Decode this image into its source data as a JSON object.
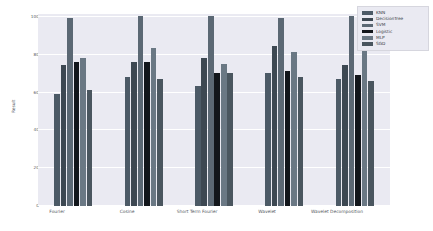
{
  "chart_data": {
    "type": "bar",
    "title": "",
    "xlabel": "",
    "ylabel": "Result",
    "ylim": [
      0,
      100
    ],
    "yticks": [
      "0",
      "20",
      "40",
      "60",
      "80",
      "100"
    ],
    "grid": true,
    "legend_position": "upper right",
    "categories": [
      "Fourier",
      "Cosine",
      "Short Term Fourier",
      "Wavelet",
      "Wavelet Decomposition"
    ],
    "series": [
      {
        "name": "KNN",
        "color": "#4c5a66",
        "values": [
          59,
          68,
          63,
          70,
          67
        ]
      },
      {
        "name": "DecisionTree",
        "color": "#3d4852",
        "values": [
          74,
          76,
          78,
          84,
          74
        ]
      },
      {
        "name": "SVM",
        "color": "#5b6874",
        "values": [
          99,
          100,
          100,
          99,
          100
        ]
      },
      {
        "name": "Logistic",
        "color": "#12161b",
        "values": [
          76,
          76,
          70,
          71,
          69
        ]
      },
      {
        "name": "MLP",
        "color": "#6a7884",
        "values": [
          78,
          83,
          75,
          81,
          86
        ]
      },
      {
        "name": "SGD",
        "color": "#4a565f",
        "values": [
          61,
          67,
          70,
          68,
          66
        ]
      }
    ]
  },
  "figure": {
    "background": "#ffffff",
    "axes_background": "#eaeaf2",
    "gridline_color": "#ffffff",
    "tick_color": "#555a63"
  }
}
